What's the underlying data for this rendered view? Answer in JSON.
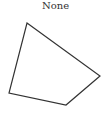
{
  "title": "None",
  "shape": {
    "type": "polygon",
    "points": [
      [
        27,
        23
      ],
      [
        100,
        76
      ],
      [
        66,
        105
      ],
      [
        9,
        93
      ]
    ],
    "stroke": "#333333",
    "fill": "#ffffff",
    "stroke_width": 1.2
  }
}
